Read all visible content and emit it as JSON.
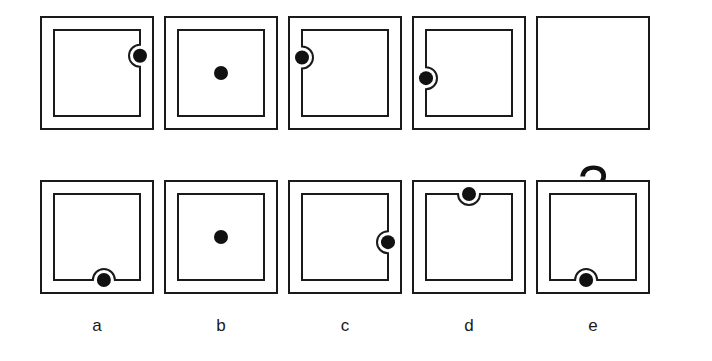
{
  "puzzle": {
    "type": "visual-analogy-matrix",
    "question_mark": "?",
    "geometry": {
      "cell_size": 114,
      "outer_inset": 0,
      "inner_inset": 14,
      "dot_radius": 7,
      "notch_radius": 11,
      "stroke": 2,
      "stroke_color": "#1a1a1a",
      "fill_color": "#ffffff",
      "dot_color": "#111111"
    },
    "row_labels": {
      "top": "sequence",
      "bottom": "options"
    },
    "sequence": [
      {
        "name": "sequence-cell-1",
        "index": 1,
        "frames": 2,
        "dot": {
          "edge": "right",
          "position": 0.3,
          "notch": true
        },
        "description": "Dot on right edge of inner square, upper third, notch bulges right"
      },
      {
        "name": "sequence-cell-2",
        "index": 2,
        "frames": 2,
        "dot": {
          "edge": "center",
          "position": 0.5,
          "notch": false
        },
        "description": "Dot at center of inner square, no notch"
      },
      {
        "name": "sequence-cell-3",
        "index": 3,
        "frames": 2,
        "dot": {
          "edge": "left",
          "position": 0.32,
          "notch": true
        },
        "description": "Dot on left edge of inner square, upper third, notch bulges left"
      },
      {
        "name": "sequence-cell-4",
        "index": 4,
        "frames": 2,
        "dot": {
          "edge": "left",
          "position": 0.56,
          "notch": true
        },
        "description": "Dot on left edge of inner square, lower middle, notch bulges left"
      },
      {
        "name": "sequence-cell-5",
        "index": 5,
        "frames": 1,
        "dot": null,
        "is_question": true,
        "description": "Single square frame containing a question mark"
      }
    ],
    "options": [
      {
        "name": "option-a",
        "label": "a",
        "frames": 2,
        "dot": {
          "edge": "bottom",
          "position": 0.58,
          "notch": true
        },
        "description": "Dot on bottom edge of inner square, right of center, notch bulges down"
      },
      {
        "name": "option-b",
        "label": "b",
        "frames": 2,
        "dot": {
          "edge": "center",
          "position": 0.5,
          "notch": false
        },
        "description": "Dot at center of inner square, no notch"
      },
      {
        "name": "option-c",
        "label": "c",
        "frames": 2,
        "dot": {
          "edge": "right",
          "position": 0.56,
          "notch": true
        },
        "description": "Dot on right edge of inner square, lower middle, notch bulges right"
      },
      {
        "name": "option-d",
        "label": "d",
        "frames": 2,
        "dot": {
          "edge": "top",
          "position": 0.5,
          "notch": true
        },
        "description": "Dot on top edge of inner square, centered, notch bulges up"
      },
      {
        "name": "option-e",
        "label": "e",
        "frames": 2,
        "dot": {
          "edge": "bottom",
          "position": 0.42,
          "notch": true
        },
        "description": "Dot on bottom edge of inner square, left of center, notch bulges down"
      }
    ],
    "layout": {
      "cell_x": [
        40,
        164,
        288,
        412,
        536
      ],
      "top_row_y": 16,
      "bottom_row_y": 180,
      "label_y": 316
    }
  }
}
